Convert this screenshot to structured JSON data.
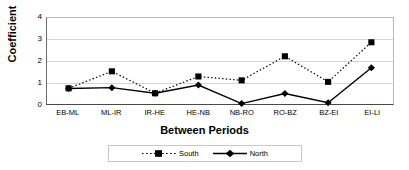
{
  "chart_data": {
    "type": "line",
    "title": "",
    "xlabel": "Between Periods",
    "ylabel": "Coefficient",
    "categories": [
      "EB-ML",
      "ML-IR",
      "IR-HE",
      "HE-NB",
      "NB-RO",
      "RO-BZ",
      "BZ-EI",
      "EI-LI"
    ],
    "series": [
      {
        "name": "South",
        "values": [
          0.73,
          1.52,
          0.5,
          1.28,
          1.1,
          2.22,
          1.03,
          2.87
        ],
        "marker": "square",
        "line_style": "dotted",
        "color": "#000000"
      },
      {
        "name": "North",
        "values": [
          0.72,
          0.76,
          0.5,
          0.88,
          0.02,
          0.49,
          0.06,
          1.69
        ],
        "marker": "diamond",
        "line_style": "solid",
        "color": "#000000"
      }
    ],
    "ylim": [
      0,
      4
    ],
    "y_ticks": [
      "0",
      "1",
      "2",
      "3",
      "4"
    ],
    "grid": true,
    "legend_position": "bottom"
  },
  "legend": {
    "entries": [
      {
        "label": "South"
      },
      {
        "label": "North"
      }
    ]
  }
}
